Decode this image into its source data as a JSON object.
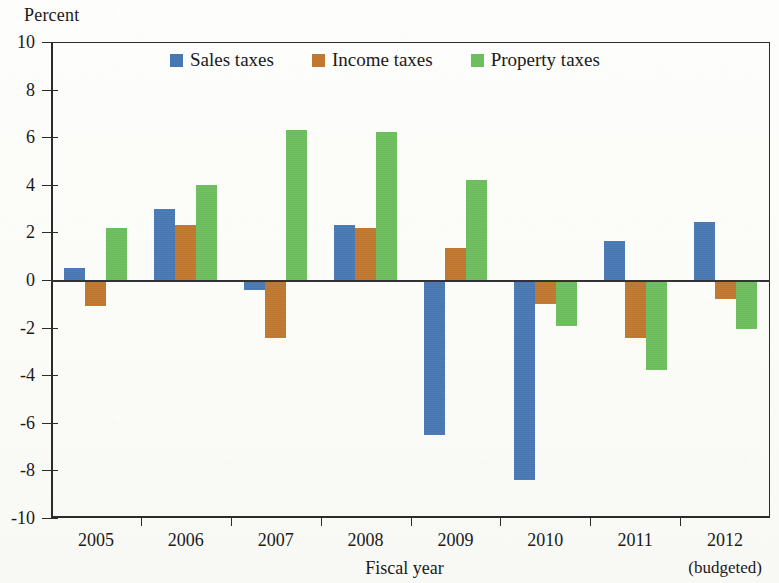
{
  "figure": {
    "y_axis_title": "Percent",
    "x_axis_title": "Fiscal year",
    "background_color": "#fdfdfb"
  },
  "legend": {
    "items": [
      {
        "label": "Sales taxes",
        "color": "#4878b4"
      },
      {
        "label": "Income taxes",
        "color": "#c1772f"
      },
      {
        "label": "Property taxes",
        "color": "#6dbe5d"
      }
    ]
  },
  "y_axis": {
    "ticks": [
      "10",
      "8",
      "6",
      "4",
      "2",
      "0",
      "-2",
      "-4",
      "-6",
      "-8",
      "-10"
    ],
    "min": -10,
    "max": 10,
    "step": 2
  },
  "x_axis": {
    "ticks": [
      "2005",
      "2006",
      "2007",
      "2008",
      "2009",
      "2010",
      "2011",
      "2012"
    ],
    "note_year": "2012",
    "note": "(budgeted)"
  },
  "chart_data": {
    "type": "bar",
    "title": "",
    "subtitle": "",
    "xlabel": "Fiscal year",
    "ylabel": "Percent",
    "ylim": [
      -10,
      10
    ],
    "ytick_step": 2,
    "grid": false,
    "legend_position": "top-center",
    "annotations": [
      "(budgeted)"
    ],
    "categories": [
      "2005",
      "2006",
      "2007",
      "2008",
      "2009",
      "2010",
      "2011",
      "2012"
    ],
    "series": [
      {
        "name": "Sales taxes",
        "color": "#4878b4",
        "values": [
          0.5,
          3.0,
          -0.4,
          2.3,
          -6.5,
          -8.4,
          1.65,
          2.45
        ]
      },
      {
        "name": "Income taxes",
        "color": "#c1772f",
        "values": [
          -1.1,
          2.3,
          -2.45,
          2.2,
          1.35,
          -1.0,
          -2.45,
          -0.8
        ]
      },
      {
        "name": "Property taxes",
        "color": "#6dbe5d",
        "values": [
          2.2,
          4.0,
          6.3,
          6.2,
          4.2,
          -1.95,
          -3.8,
          -2.05
        ]
      }
    ]
  }
}
